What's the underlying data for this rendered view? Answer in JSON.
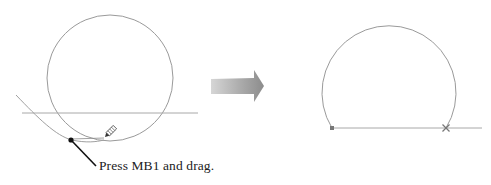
{
  "figure": {
    "caption": "Press MB1 and drag.",
    "colors": {
      "geometry": "#9a9a9a",
      "leader": "#111111",
      "arrow_light": "#d2d2d2",
      "arrow_dark": "#8a8a8a",
      "marker": "#666666"
    },
    "before": {
      "label": "Sketch before trim: full circle, horizontal line and curve with drag path",
      "circle": {
        "cx": 110,
        "cy": 78,
        "r": 63
      },
      "horizontal_line": {
        "x1": 22,
        "y1": 113,
        "x2": 198,
        "y2": 113
      },
      "drag_point": {
        "x": 71,
        "y": 140
      },
      "cursor_icon": "pencil-icon"
    },
    "transition_arrow_icon": "right-arrow-icon",
    "after": {
      "label": "Sketch after trim: arc closed by horizontal line",
      "arc": {
        "cx": 389,
        "cy": 89,
        "r": 67
      },
      "baseline": {
        "x1": 332,
        "y1": 128,
        "x2": 482,
        "y2": 128
      },
      "start_marker": {
        "x": 332,
        "y": 128,
        "shape": "square"
      },
      "end_marker": {
        "x": 446,
        "y": 128,
        "shape": "cross"
      }
    }
  }
}
